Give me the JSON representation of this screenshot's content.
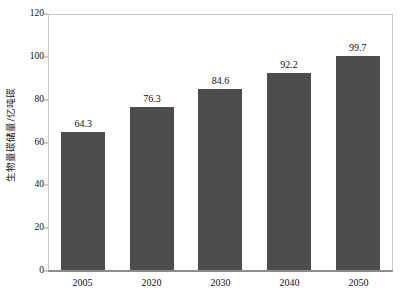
{
  "chart_data": {
    "type": "bar",
    "title": "",
    "xlabel": "",
    "ylabel": "生物量碳储量/亿吨碳",
    "categories": [
      "2005",
      "2020",
      "2030",
      "2040",
      "2050"
    ],
    "values": [
      64.3,
      76.3,
      84.6,
      92.2,
      99.7
    ],
    "value_labels": [
      "64.3",
      "76.3",
      "84.6",
      "92.2",
      "99.7"
    ],
    "ylim": [
      0,
      120
    ],
    "yticks": [
      0,
      20,
      40,
      60,
      80,
      100,
      120
    ],
    "ytick_labels": [
      "0",
      "20",
      "40",
      "60",
      "80",
      "100",
      "120"
    ],
    "grid": false,
    "legend": false,
    "bar_color": "#4d4d4d",
    "axis_color": "#8c8c8c",
    "frame_color": "#c8c8c8",
    "text_color": "#111111",
    "background": "#ffffff"
  }
}
